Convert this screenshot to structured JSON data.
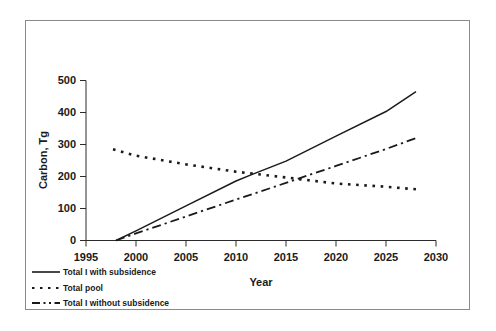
{
  "chart_data": {
    "type": "line",
    "title": "",
    "xlabel": "Year",
    "ylabel": "Carbon, Tg",
    "xlim": [
      1995,
      2030
    ],
    "ylim": [
      0,
      500
    ],
    "xticks": [
      1995,
      2000,
      2005,
      2010,
      2015,
      2020,
      2025,
      2030
    ],
    "yticks": [
      0,
      100,
      200,
      300,
      400,
      500
    ],
    "grid": false,
    "legend_position": "below-left",
    "series": [
      {
        "name": "Total I with subsidence",
        "style": "solid",
        "x": [
          1998,
          2000,
          2005,
          2010,
          2011.5,
          2015,
          2020,
          2025,
          2028
        ],
        "values": [
          0,
          30,
          108,
          186,
          205,
          248,
          326,
          403,
          465
        ]
      },
      {
        "name": "Total pool",
        "style": "dotted",
        "x": [
          1997.7,
          2000,
          2005,
          2010,
          2015,
          2016,
          2020,
          2025,
          2028
        ],
        "values": [
          285,
          265,
          238,
          215,
          197,
          193,
          178,
          168,
          160
        ]
      },
      {
        "name": "Total I without subsidence",
        "style": "dashed",
        "x": [
          1998,
          2000,
          2005,
          2010,
          2015,
          2016,
          2020,
          2025,
          2028
        ],
        "values": [
          0,
          22,
          75,
          128,
          180,
          191,
          233,
          286,
          320
        ]
      }
    ]
  },
  "axes": {
    "ylabel": "Carbon, Tg",
    "xlabel": "Year",
    "ytick_labels": [
      "500",
      "400",
      "300",
      "200",
      "100",
      "0"
    ],
    "xtick_labels": [
      "1995",
      "2000",
      "2005",
      "2010",
      "2015",
      "2020",
      "2025",
      "2030"
    ]
  },
  "legend": {
    "items": [
      {
        "label": "Total I with subsidence",
        "style": "solid"
      },
      {
        "label": "Total pool",
        "style": "dotted"
      },
      {
        "label": "Total I without subsidence",
        "style": "dashed"
      }
    ]
  },
  "colors": {
    "line": "#1a1a1a",
    "axis": "#2b2b2b",
    "frame": "#8a8a8a",
    "background": "#ffffff"
  }
}
